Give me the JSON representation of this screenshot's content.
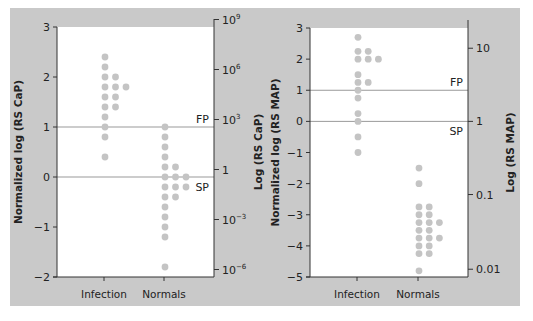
{
  "chart_data": [
    {
      "type": "scatter",
      "subtype": "dot-plot",
      "xlabel": "",
      "ylabel": "Normalized log (RS CaP)",
      "ylabel_right": "Log (RS CaP)",
      "categories": [
        "Infection",
        "Normals"
      ],
      "ylim": [
        -2,
        3
      ],
      "yticks": [
        3,
        2,
        1,
        0,
        -1,
        -2
      ],
      "ytick_labels": [
        "3",
        "2",
        "1",
        "0",
        "−1",
        "−2"
      ],
      "right_ticks": [
        {
          "label": "10",
          "sup": "9",
          "norm": 3.15
        },
        {
          "label": "10",
          "sup": "6",
          "norm": 2.15
        },
        {
          "label": "10",
          "sup": "3",
          "norm": 1.15
        },
        {
          "label": "1",
          "sup": "",
          "norm": 0.15
        },
        {
          "label": "10",
          "sup": "−3",
          "norm": -0.85
        },
        {
          "label": "10",
          "sup": "−6",
          "norm": -1.85
        }
      ],
      "reference_lines": [
        {
          "label": "FP",
          "y": 1
        },
        {
          "label": "SP",
          "y": 0
        }
      ],
      "series": [
        {
          "name": "Infection",
          "values": [
            2.4,
            2.2,
            2.0,
            2.0,
            1.8,
            1.8,
            1.8,
            1.6,
            1.6,
            1.4,
            1.4,
            1.2,
            1.0,
            0.8,
            0.4
          ]
        },
        {
          "name": "Normals",
          "values": [
            1.0,
            0.8,
            0.6,
            0.4,
            0.2,
            0.2,
            0.0,
            0.0,
            0.0,
            -0.2,
            -0.2,
            -0.2,
            -0.4,
            -0.4,
            -0.6,
            -0.8,
            -1.0,
            -1.2,
            -1.8
          ]
        }
      ],
      "grid": false,
      "legend": "none"
    },
    {
      "type": "scatter",
      "subtype": "dot-plot",
      "xlabel": "",
      "ylabel": "Normalized log (RS MAP)",
      "ylabel_right": "Log (RS MAP)",
      "categories": [
        "Infection",
        "Normals"
      ],
      "ylim": [
        -5,
        3
      ],
      "yticks": [
        3,
        2,
        1,
        0,
        -1,
        -2,
        -3,
        -4,
        -5
      ],
      "ytick_labels": [
        "3",
        "2",
        "1",
        "0",
        "−1",
        "−2",
        "−3",
        "−4",
        "−5"
      ],
      "right_ticks": [
        {
          "label": "10",
          "sup": "",
          "norm": 2.35
        },
        {
          "label": "1",
          "sup": "",
          "norm": 0.0
        },
        {
          "label": "0.1",
          "sup": "",
          "norm": -2.35
        },
        {
          "label": "0.01",
          "sup": "",
          "norm": -4.75
        }
      ],
      "reference_lines": [
        {
          "label": "FP",
          "y": 1
        },
        {
          "label": "SP",
          "y": 0
        }
      ],
      "series": [
        {
          "name": "Infection",
          "values": [
            2.7,
            2.25,
            2.25,
            2.0,
            2.0,
            2.0,
            1.5,
            1.25,
            1.25,
            1.0,
            0.75,
            0.25,
            0.0,
            -0.5,
            -1.0
          ]
        },
        {
          "name": "Normals",
          "values": [
            -1.5,
            -2.0,
            -2.75,
            -2.75,
            -3.0,
            -3.0,
            -3.25,
            -3.25,
            -3.25,
            -3.5,
            -3.5,
            -3.75,
            -3.75,
            -3.75,
            -4.0,
            -4.0,
            -4.25,
            -4.25,
            -4.8
          ]
        }
      ],
      "grid": false,
      "legend": "none"
    }
  ],
  "colors": {
    "panel_background": "#c9c9c9",
    "plot_background": "#ffffff",
    "dot": "#c4c4c4",
    "reference_line": "#999999",
    "axis": "#333333"
  },
  "labels": {
    "fp": "FP",
    "sp": "SP"
  }
}
